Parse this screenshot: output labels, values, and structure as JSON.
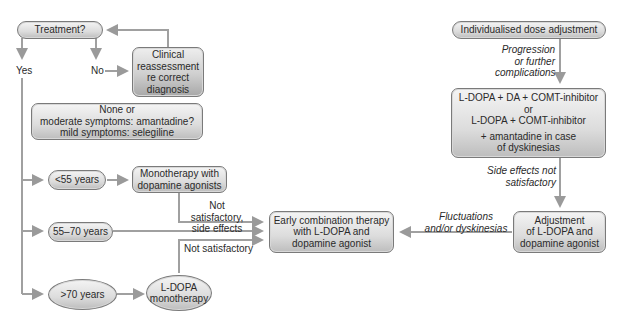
{
  "diagram": {
    "type": "flowchart",
    "nodes": {
      "treatment": "Treatment?",
      "clinical": [
        "Clinical",
        "reassessment",
        "re correct",
        "diagnosis"
      ],
      "none_or": [
        "None or",
        "moderate symptoms: amantadine?",
        "mild symptoms: selegiline"
      ],
      "under55": "<55 years",
      "monotherapy_da": [
        "Monotherapy with",
        "dopamine agonists"
      ],
      "age55_70": "55–70 years",
      "over70": ">70 years",
      "ldopa_mono": [
        "L-DOPA",
        "monotherapy"
      ],
      "early_combo": [
        "Early combination therapy",
        "with L-DOPA and",
        "dopamine agonist"
      ],
      "individualised": "Individualised dose adjustment",
      "combo_right": [
        "L-DOPA + DA + COMT-inhibitor",
        "or",
        "L-DOPA + COMT-inhibitor"
      ],
      "combo_right_extra": [
        "+ amantadine in case",
        "of dyskinesias"
      ],
      "adjustment": [
        "Adjustment",
        "of L-DOPA and",
        "dopamine agonist"
      ]
    },
    "edge_labels": {
      "yes": "Yes",
      "no": "No",
      "not_satisfactory_side": [
        "Not satisfactory,",
        "side effects"
      ],
      "not_satisfactory": "Not satisfactory",
      "progression": [
        "Progression",
        "or further",
        "complications"
      ],
      "side_effects_not": [
        "Side effects not",
        "satisfactory"
      ],
      "fluctuations": [
        "Fluctuations",
        "and/or dyskinesias"
      ]
    },
    "colors": {
      "line": "#9a9a9a",
      "box_border": "#7a7a7a",
      "box_fill_top": "#f4f4f4",
      "box_fill_bottom": "#bdbdbd"
    }
  }
}
